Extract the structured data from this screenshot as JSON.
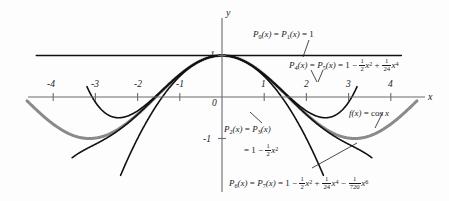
{
  "figure": {
    "background_color": "#fdfdfd",
    "curve_color_cos": "#8a8a8a",
    "curve_color_poly": "#111111",
    "axis_color": "#6b6b70"
  },
  "axes": {
    "x_label": "x",
    "y_label": "y",
    "x_ticks": [
      "-4",
      "-3",
      "-2",
      "-1",
      "1",
      "2",
      "3",
      "4"
    ],
    "x_tick_values": [
      -4,
      -3,
      -2,
      -1,
      1,
      2,
      3,
      4
    ],
    "y_ticks": [
      "1",
      "0",
      "-1"
    ],
    "y_tick_values": [
      1,
      0,
      -1
    ],
    "origin_label": "0",
    "xlim": [
      -4.7,
      4.9
    ],
    "ylim": [
      -1.9,
      1.45
    ]
  },
  "labels": {
    "p0": {
      "parts": [
        "P",
        "0",
        "(x) = P",
        "1",
        "(x) = 1"
      ],
      "text": "P0(x) = P1(x) = 1"
    },
    "p4": {
      "text": "P4(x) = P5(x) = 1 - 1/2 x^2 + 1/24 x^4",
      "lead": "P",
      "sub1": "4",
      "mid": "(x) = P",
      "sub2": "5",
      "eq": "(x) = 1 − ",
      "f1n": "1",
      "f1d": "2",
      "t1": "x",
      "t1p": "2",
      "plus": " + ",
      "f2n": "1",
      "f2d": "24",
      "t2": "x",
      "t2p": "4"
    },
    "p2": {
      "line1_text": "P2(x) = P3(x)",
      "line2_text": "= 1 - 1/2 x^2",
      "lead": "P",
      "sub1": "2",
      "mid": "(x) = P",
      "sub2": "3",
      "tail": "(x)",
      "eq": "= 1 − ",
      "f1n": "1",
      "f1d": "2",
      "t1": "x",
      "t1p": "2"
    },
    "p6": {
      "text": "P6(x) = P7(x) = 1 - 1/2 x^2 + 1/24 x^4 - 1/720 x^6",
      "lead": "P",
      "sub1": "6",
      "mid": "(x) = P",
      "sub2": "7",
      "eq": "(x) = 1 − ",
      "f1n": "1",
      "f1d": "2",
      "t1": "x",
      "t1p": "2",
      "plus": " + ",
      "f2n": "1",
      "f2d": "24",
      "t2": "x",
      "t2p": "4",
      "minus": " − ",
      "f3n": "1",
      "f3d": "720",
      "t3": "x",
      "t3p": "6"
    },
    "fcos": {
      "text": "f(x) = cos x",
      "lead": "f",
      "args": "(x) = cos ",
      "var": "x"
    }
  },
  "chart_data": {
    "type": "line",
    "xlabel": "x",
    "ylabel": "y",
    "xlim": [
      -4.7,
      4.9
    ],
    "ylim": [
      -1.9,
      1.45
    ],
    "grid": false,
    "legend_position": "annotations-on-plot",
    "x_ticks": [
      -4,
      -3,
      -2,
      -1,
      0,
      1,
      2,
      3,
      4
    ],
    "y_ticks": [
      -1,
      0,
      1
    ],
    "series": [
      {
        "name": "f(x) = cos x",
        "color": "#8a8a8a",
        "width": 3.0,
        "expression": "cos(x)",
        "domain": [
          -4.62,
          4.62
        ]
      },
      {
        "name": "P0(x) = P1(x) = 1",
        "color": "#111111",
        "width": 1.6,
        "expression": "1",
        "domain": [
          -4.4,
          4.25
        ]
      },
      {
        "name": "P2(x) = P3(x) = 1 - x^2/2",
        "color": "#111111",
        "width": 1.6,
        "expression": "1 - x^2/2",
        "domain": [
          -2.45,
          2.45
        ]
      },
      {
        "name": "P4(x) = P5(x) = 1 - x^2/2 + x^4/24",
        "color": "#111111",
        "width": 1.6,
        "expression": "1 - x^2/2 + x^4/24",
        "domain": [
          -3.2,
          3.2
        ]
      },
      {
        "name": "P6(x) = P7(x) = 1 - x^2/2 + x^4/24 - x^6/720",
        "color": "#111111",
        "width": 1.6,
        "expression": "1 - x^2/2 + x^4/24 - x^6/720",
        "domain": [
          -3.55,
          3.55
        ]
      }
    ]
  }
}
